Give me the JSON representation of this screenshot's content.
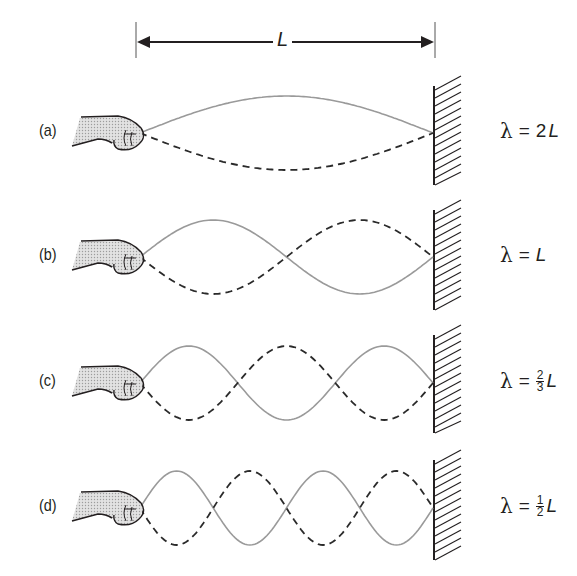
{
  "diagram": {
    "length_label": "L",
    "colors": {
      "solid_wave": "#9a9a9a",
      "dashed_wave": "#2a2a2a",
      "ink": "#231f20",
      "hand_fill": "#d4d4d4"
    },
    "geometry": {
      "x_start": 140,
      "x_end": 433,
      "amplitude": 37
    },
    "cases": [
      {
        "label": "(a)",
        "center_y": 133,
        "half_waves": 1,
        "lambda_text": "λ",
        "equals": "=",
        "coef": "2",
        "frac_num": "",
        "frac_den": "",
        "var": "L",
        "wall_top": 86,
        "wall_bottom": 185
      },
      {
        "label": "(b)",
        "center_y": 257,
        "half_waves": 2,
        "lambda_text": "λ",
        "equals": "=",
        "coef": "",
        "frac_num": "",
        "frac_den": "",
        "var": "L",
        "wall_top": 210,
        "wall_bottom": 310
      },
      {
        "label": "(c)",
        "center_y": 383,
        "half_waves": 3,
        "lambda_text": "λ",
        "equals": "=",
        "coef": "",
        "frac_num": "2",
        "frac_den": "3",
        "var": "L",
        "wall_top": 335,
        "wall_bottom": 433
      },
      {
        "label": "(d)",
        "center_y": 508,
        "half_waves": 4,
        "lambda_text": "λ",
        "equals": "=",
        "coef": "",
        "frac_num": "1",
        "frac_den": "2",
        "var": "L",
        "wall_top": 460,
        "wall_bottom": 560
      }
    ]
  }
}
